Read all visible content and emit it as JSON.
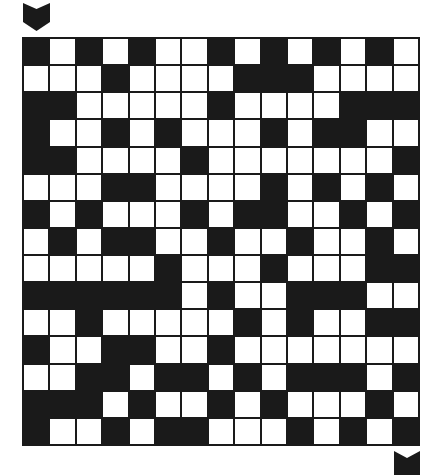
{
  "puzzle": {
    "type": "maze-grid",
    "rows": 15,
    "cols": 15,
    "legend": {
      "B": "wall",
      "W": "open"
    },
    "colors": {
      "wall": "#1a1a1a",
      "open": "#ffffff",
      "background": "#ffffff"
    },
    "start_marker": {
      "icon": "chevron-down-icon",
      "position": "top-left",
      "col": 0
    },
    "end_marker": {
      "icon": "notched-arrow-icon",
      "position": "bottom-right",
      "col": 14
    },
    "grid": [
      "BWBWBWWBWBWBWBW",
      "WWWBWWWWBBBWWWW",
      "BBWWWWWBWWWWBBB",
      "BWWBWBWWWBWBBWW",
      "BBWWWWBWWWWWWWB",
      "WWWBBWWWWBWBWBW",
      "BWBWWWBWBBWWBWB",
      "WBWBBWWBWWBWWBW",
      "WWWWWBWWWBWWWBB",
      "BBBBBBWBWWBBBWW",
      "WWBWWWWWBWBWWBB",
      "BWWBBWWBWWWWWWW",
      "WWBBWBBWBWBBBWB",
      "BBBWBWWBWBWWWBW",
      "BWWBWBBWWWBWBWB"
    ]
  }
}
